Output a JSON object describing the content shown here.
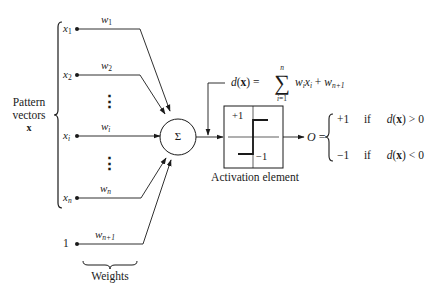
{
  "diagram": {
    "type": "perceptron",
    "input_group_label": {
      "line1": "Pattern",
      "line2": "vectors",
      "symbol": "x"
    },
    "inputs": [
      {
        "name": "x",
        "sub": "1",
        "weight": "w",
        "weight_sub": "1"
      },
      {
        "name": "x",
        "sub": "2",
        "weight": "w",
        "weight_sub": "2"
      },
      {
        "name": "x",
        "sub": "i",
        "weight": "w",
        "weight_sub": "i"
      },
      {
        "name": "x",
        "sub": "n",
        "weight": "w",
        "weight_sub": "n"
      }
    ],
    "bias_input": {
      "name": "1",
      "weight": "w",
      "weight_sub": "n+1"
    },
    "ellipsis": "⋮",
    "weights_label": "Weights",
    "summation_symbol": "Σ",
    "equation": {
      "lhs_d": "d",
      "lhs_x": "x",
      "equals": "=",
      "sum_symbol": "∑",
      "sum_upper": "n",
      "sum_lower": "i=1",
      "term_w": "w",
      "term_w_sub": "i",
      "term_x": "x",
      "term_x_sub": "i",
      "plus": "+",
      "bias_w": "w",
      "bias_w_sub": "n+1"
    },
    "activation": {
      "label": "Activation element",
      "upper": "+1",
      "lower": "−1"
    },
    "output": {
      "symbol": "O",
      "equals": "=",
      "cases": [
        {
          "value": "+1",
          "cond_word": "if",
          "cond_d": "d",
          "cond_x": "x",
          "cond_op": "> 0"
        },
        {
          "value": "−1",
          "cond_word": "if",
          "cond_d": "d",
          "cond_x": "x",
          "cond_op": "< 0"
        }
      ]
    },
    "colors": {
      "line": "#1a1a1a",
      "background": "#ffffff"
    }
  }
}
